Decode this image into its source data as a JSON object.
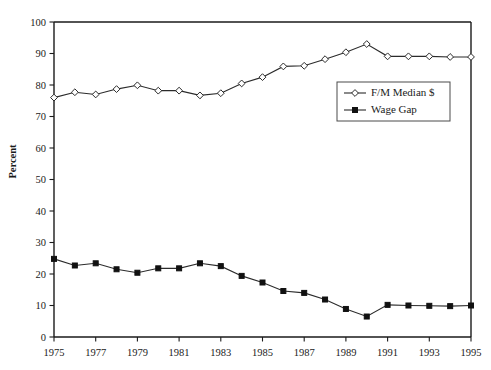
{
  "chart_data": {
    "type": "line",
    "title": "",
    "subtitle": "",
    "xlabel": "",
    "ylabel": "Percent",
    "xlim": [
      1975,
      1995
    ],
    "ylim": [
      0,
      100
    ],
    "grid": false,
    "legend_position": "upper-right-inside",
    "x": [
      1975,
      1976,
      1977,
      1978,
      1979,
      1980,
      1981,
      1982,
      1983,
      1984,
      1985,
      1986,
      1987,
      1988,
      1989,
      1990,
      1991,
      1992,
      1993,
      1994,
      1995
    ],
    "xtick_labels": [
      "1975",
      "1977",
      "1979",
      "1981",
      "1983",
      "1985",
      "1987",
      "1989",
      "1991",
      "1993",
      "1995"
    ],
    "xtick_values": [
      1975,
      1977,
      1979,
      1981,
      1983,
      1985,
      1987,
      1989,
      1991,
      1993,
      1995
    ],
    "ytick_labels": [
      "0",
      "10",
      "20",
      "30",
      "40",
      "50",
      "60",
      "70",
      "80",
      "90",
      "100"
    ],
    "ytick_values": [
      0,
      10,
      20,
      30,
      40,
      50,
      60,
      70,
      80,
      90,
      100
    ],
    "series": [
      {
        "name": "F/M Median $",
        "marker": "open-diamond",
        "color": "#2b2b2b",
        "values": [
          76.0,
          77.7,
          77.0,
          78.7,
          79.9,
          78.2,
          78.2,
          76.7,
          77.4,
          80.5,
          82.5,
          85.9,
          86.1,
          88.2,
          90.4,
          93.0,
          89.1,
          89.1,
          89.1,
          88.9,
          88.9
        ]
      },
      {
        "name": "Wage Gap",
        "marker": "filled-square",
        "color": "#111111",
        "values": [
          24.8,
          22.7,
          23.4,
          21.5,
          20.4,
          21.8,
          21.8,
          23.4,
          22.5,
          19.4,
          17.3,
          14.6,
          14.0,
          11.9,
          8.9,
          6.5,
          10.2,
          10.0,
          9.9,
          9.8,
          10.0
        ]
      }
    ]
  },
  "legend": {
    "entries": [
      {
        "label": "F/M Median $",
        "marker": "open-diamond"
      },
      {
        "label": "Wage Gap",
        "marker": "filled-square"
      }
    ]
  },
  "axes": {
    "y_axis_title": "Percent"
  }
}
